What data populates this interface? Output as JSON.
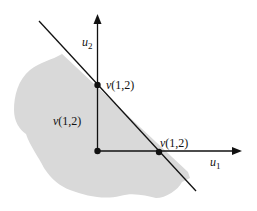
{
  "diagram": {
    "axes": {
      "horizontal": {
        "label": "u",
        "subscript": "1"
      },
      "vertical": {
        "label": "u",
        "subscript": "2"
      }
    },
    "points": [
      {
        "id": "origin",
        "label": ""
      },
      {
        "id": "on-u2-axis",
        "label_v": "v",
        "label_args": "(1,2)"
      },
      {
        "id": "on-u1-axis",
        "label_v": "v",
        "label_args": "(1,2)"
      }
    ],
    "region_label": {
      "v": "v",
      "args": "(1,2)"
    },
    "colors": {
      "region_fill": "#d9d9d9",
      "line": "#111111",
      "background": "#ffffff"
    }
  }
}
